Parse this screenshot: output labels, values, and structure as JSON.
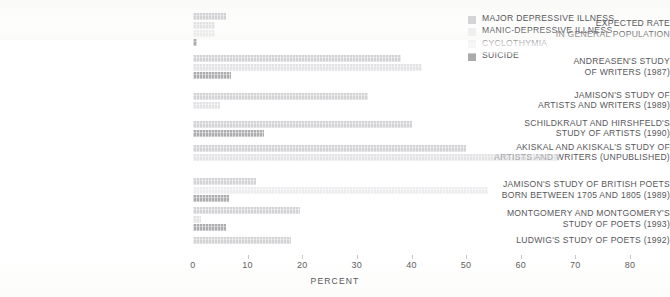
{
  "chart_data": {
    "type": "bar",
    "orientation": "horizontal",
    "title": "",
    "xlabel": "PERCENT",
    "ylabel": "",
    "xlim": [
      0,
      80
    ],
    "xticks": [
      0,
      10,
      20,
      30,
      40,
      50,
      60,
      70,
      80
    ],
    "grid": false,
    "legend_position": "top-right",
    "categories": [
      "EXPECTED RATE\nIN GENERAL POPULATION",
      "ANDREASEN'S STUDY\nOF WRITERS (1987)",
      "JAMISON'S STUDY OF\nARTISTS AND WRITERS (1989)",
      "SCHILDKRAUT AND HIRSHFELD'S\nSTUDY OF ARTISTS (1990)",
      "AKISKAL AND AKISKAL'S STUDY OF\nARTISTS AND WRITERS (UNPUBLISHED)",
      "JAMISON'S STUDY OF BRITISH POETS\nBORN BETWEEN 1705 AND 1805 (1989)",
      "MONTGOMERY AND MONTGOMERY'S\nSTUDY OF POETS (1993)",
      "LUDWIG'S STUDY OF POETS (1992)"
    ],
    "series": [
      {
        "name": "MAJOR DEPRESSIVE ILLNESS",
        "color": "#b9b9be",
        "values": [
          6,
          38,
          32,
          40,
          50,
          11.5,
          19.5,
          18
        ]
      },
      {
        "name": "MANIC-DEPRESSIVE ILLNESS",
        "color": "#d8d8dc",
        "values": [
          4,
          42,
          5,
          0,
          67,
          0,
          1.5,
          0
        ]
      },
      {
        "name": "CYCLOTHYMIA",
        "color": "#cfcfd3",
        "values": [
          4,
          0,
          0,
          0,
          0,
          54,
          0,
          0
        ]
      },
      {
        "name": "SUICIDE",
        "color": "#8e8e92",
        "values": [
          0.8,
          7,
          0,
          13,
          0,
          6.5,
          6,
          0
        ]
      }
    ]
  },
  "legend": {
    "items": [
      {
        "label": "MAJOR DEPRESSIVE ILLNESS",
        "swatch": "legend-swatch-major-depressive"
      },
      {
        "label": "MANIC-DEPRESSIVE ILLNESS",
        "swatch": "legend-swatch-manic-depressive"
      },
      {
        "label": "CYCLOTHYMIA",
        "swatch": "legend-swatch-cyclothymia"
      },
      {
        "label": "SUICIDE",
        "swatch": "legend-swatch-suicide"
      }
    ]
  }
}
